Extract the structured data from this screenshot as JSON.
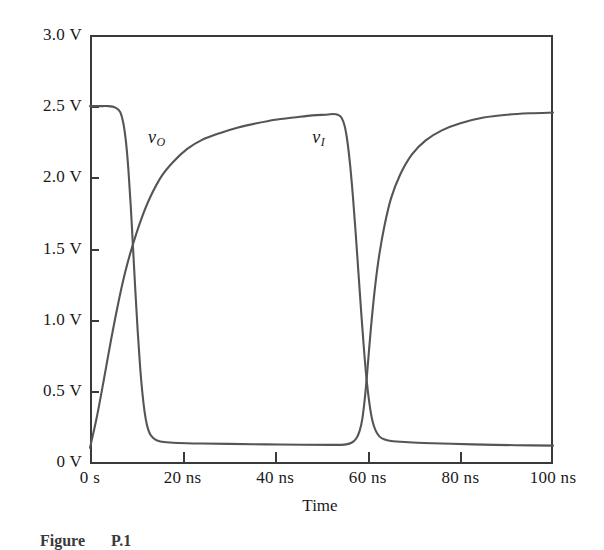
{
  "figure": {
    "caption_label": "Figure",
    "caption_number": "P.1"
  },
  "chart_data": {
    "type": "line",
    "title": "",
    "xlabel": "Time",
    "ylabel": "",
    "xlim": [
      0,
      100
    ],
    "ylim": [
      0,
      3.0
    ],
    "grid": false,
    "legend": "inline-annotations",
    "x_unit": "ns",
    "y_unit": "V",
    "x_tick_values": [
      0,
      20,
      40,
      60,
      80,
      100
    ],
    "x_tick_labels": [
      "0 s",
      "20 ns",
      "40 ns",
      "60 ns",
      "80 ns",
      "100 ns"
    ],
    "y_tick_values": [
      0,
      0.5,
      1.0,
      1.5,
      2.0,
      2.5,
      3.0
    ],
    "y_tick_labels": [
      "0 V",
      "0.5 V",
      "1.0 V",
      "1.5 V",
      "2.0 V",
      "2.5 V",
      "3.0 V"
    ],
    "annotations": [
      {
        "text": "vO",
        "base": "v",
        "sub": "O",
        "x": 12.5,
        "y": 2.28
      },
      {
        "text": "vI",
        "base": "v",
        "sub": "I",
        "x": 48.0,
        "y": 2.28
      }
    ],
    "series": [
      {
        "name": "vO",
        "label_base": "v",
        "label_sub": "O",
        "color": "#555555",
        "width": 2.1,
        "points": [
          [
            0,
            2.5
          ],
          [
            2,
            2.5
          ],
          [
            4,
            2.5
          ],
          [
            5.5,
            2.49
          ],
          [
            6.5,
            2.46
          ],
          [
            7.2,
            2.38
          ],
          [
            7.8,
            2.24
          ],
          [
            8.3,
            2.05
          ],
          [
            8.8,
            1.8
          ],
          [
            9.3,
            1.5
          ],
          [
            9.8,
            1.2
          ],
          [
            10.3,
            0.92
          ],
          [
            10.8,
            0.68
          ],
          [
            11.3,
            0.49
          ],
          [
            11.8,
            0.35
          ],
          [
            12.3,
            0.26
          ],
          [
            12.9,
            0.2
          ],
          [
            13.6,
            0.17
          ],
          [
            14.5,
            0.151
          ],
          [
            16,
            0.14
          ],
          [
            19,
            0.134
          ],
          [
            24,
            0.13
          ],
          [
            30,
            0.127
          ],
          [
            38,
            0.124
          ],
          [
            46,
            0.121
          ],
          [
            52,
            0.12
          ],
          [
            55,
            0.122
          ],
          [
            56.5,
            0.135
          ],
          [
            57.5,
            0.165
          ],
          [
            58.2,
            0.215
          ],
          [
            58.8,
            0.3
          ],
          [
            59.3,
            0.43
          ],
          [
            59.8,
            0.6
          ],
          [
            60.3,
            0.8
          ],
          [
            60.9,
            1.02
          ],
          [
            61.6,
            1.24
          ],
          [
            62.5,
            1.46
          ],
          [
            63.6,
            1.66
          ],
          [
            65,
            1.85
          ],
          [
            67,
            2.02
          ],
          [
            69.5,
            2.16
          ],
          [
            72.5,
            2.26
          ],
          [
            76,
            2.33
          ],
          [
            80,
            2.38
          ],
          [
            85,
            2.42
          ],
          [
            90,
            2.44
          ],
          [
            95,
            2.45
          ],
          [
            100,
            2.455
          ]
        ]
      },
      {
        "name": "vI",
        "label_base": "v",
        "label_sub": "I",
        "color": "#555555",
        "width": 2.1,
        "points": [
          [
            0,
            0.1
          ],
          [
            1.5,
            0.32
          ],
          [
            3,
            0.58
          ],
          [
            4.5,
            0.85
          ],
          [
            6,
            1.1
          ],
          [
            7.5,
            1.32
          ],
          [
            9,
            1.5
          ],
          [
            11,
            1.7
          ],
          [
            13,
            1.86
          ],
          [
            15.5,
            2.01
          ],
          [
            18,
            2.11
          ],
          [
            21,
            2.2
          ],
          [
            24,
            2.26
          ],
          [
            28,
            2.31
          ],
          [
            32,
            2.35
          ],
          [
            36,
            2.38
          ],
          [
            40,
            2.405
          ],
          [
            44,
            2.42
          ],
          [
            48,
            2.435
          ],
          [
            51,
            2.44
          ],
          [
            52.5,
            2.445
          ],
          [
            53.5,
            2.44
          ],
          [
            54.3,
            2.42
          ],
          [
            55,
            2.36
          ],
          [
            55.6,
            2.25
          ],
          [
            56.2,
            2.08
          ],
          [
            56.8,
            1.86
          ],
          [
            57.4,
            1.6
          ],
          [
            58,
            1.32
          ],
          [
            58.6,
            1.04
          ],
          [
            59.2,
            0.78
          ],
          [
            59.8,
            0.56
          ],
          [
            60.4,
            0.4
          ],
          [
            61,
            0.29
          ],
          [
            61.7,
            0.22
          ],
          [
            62.5,
            0.18
          ],
          [
            63.5,
            0.16
          ],
          [
            65,
            0.148
          ],
          [
            68,
            0.14
          ],
          [
            72,
            0.134
          ],
          [
            78,
            0.128
          ],
          [
            85,
            0.122
          ],
          [
            92,
            0.118
          ],
          [
            100,
            0.115
          ]
        ]
      }
    ]
  }
}
